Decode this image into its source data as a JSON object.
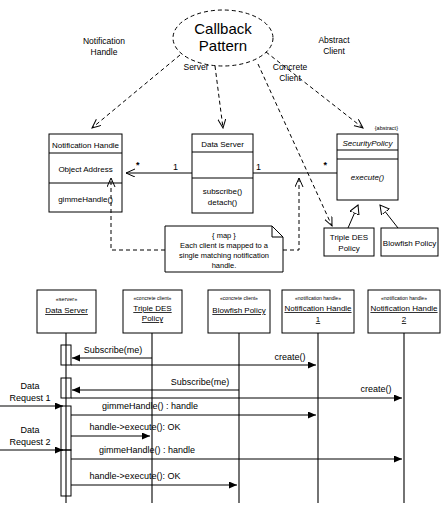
{
  "diagram": {
    "title": "Callback Pattern",
    "pattern_bubble": "Callback\nPattern",
    "pattern_line1": "Callback",
    "pattern_line2": "Pattern"
  },
  "role_labels": [
    {
      "id": "notification-handle",
      "line1": "Notification",
      "line2": "Handle"
    },
    {
      "id": "server",
      "line1": "Server",
      "line2": ""
    },
    {
      "id": "concrete-client",
      "line1": "Concrete",
      "line2": "Client"
    },
    {
      "id": "abstract-client",
      "line1": "Abstract",
      "line2": "Client"
    }
  ],
  "class_diagram": {
    "notification_handle": {
      "name": "Notification Handle",
      "attribute": "Object Address",
      "operation": "gimmeHandle()"
    },
    "data_server": {
      "name": "Data Server",
      "attribute": "",
      "operation_1": "subscribe()",
      "operation_2": "detach()"
    },
    "security_policy": {
      "stereotype": "{abstract}",
      "name": "SecurityPolicy",
      "attribute": "",
      "operation": "execute()"
    },
    "triple_des": {
      "line1": "Triple DES",
      "line2": "Policy"
    },
    "blowfish": {
      "line1": "Blowfish Policy",
      "line2": ""
    },
    "multiplicity_star_left": "*",
    "multiplicity_one_left": "1",
    "multiplicity_one_right": "1",
    "multiplicity_star_right": "*",
    "note": {
      "header": "{ map }",
      "line1": "Each client is mapped to a",
      "line2": "single matching notification",
      "line3": "handle."
    }
  },
  "sequence_diagram": {
    "lifelines": [
      {
        "stereotype": "«server»",
        "name_line1": "Data Server",
        "name_line2": ""
      },
      {
        "stereotype": "«concrete client»",
        "name_line1": "Triple DES",
        "name_line2": "Policy"
      },
      {
        "stereotype": "«concrete client»",
        "name_line1": "Blowfish Policy",
        "name_line2": ""
      },
      {
        "stereotype": "«notification handle»",
        "name_line1": "Notification Handle",
        "name_line2": "1"
      },
      {
        "stereotype": "«notification handle»",
        "name_line1": "Notification Handle",
        "name_line2": "2"
      }
    ],
    "external_actors": [
      {
        "line1": "Data",
        "line2": "Request 1"
      },
      {
        "line1": "Data",
        "line2": "Request 2"
      }
    ],
    "messages": [
      {
        "id": "m1",
        "label": "Subscribe(me)"
      },
      {
        "id": "m2",
        "label": "create()"
      },
      {
        "id": "m3",
        "label": "Subscribe(me)"
      },
      {
        "id": "m4",
        "label": "create()"
      },
      {
        "id": "m5",
        "label": "gimmeHandle() : handle"
      },
      {
        "id": "m6",
        "label": "handle->execute(): OK"
      },
      {
        "id": "m7",
        "label": "gimmeHandle() : handle"
      },
      {
        "id": "m8",
        "label": "handle->execute(): OK"
      }
    ]
  },
  "colors": {
    "stroke": "#000000",
    "background": "#ffffff"
  }
}
